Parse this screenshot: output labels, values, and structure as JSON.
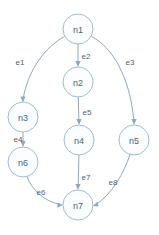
{
  "diagram": {
    "type": "directed-graph",
    "title": "",
    "canvas": {
      "width": 159,
      "height": 235,
      "background": "#ffffff"
    },
    "style": {
      "node_stroke": "#9fbbd4",
      "node_fill": "#fbfdfe",
      "node_radius": 15,
      "edge_stroke": "#8fa8bf",
      "label_color": "#4a5f7a"
    },
    "nodes": [
      {
        "id": "n1",
        "label": "n1",
        "cx": 78,
        "cy": 29
      },
      {
        "id": "n2",
        "label": "n2",
        "cx": 78,
        "cy": 82
      },
      {
        "id": "n3",
        "label": "n3",
        "cx": 23,
        "cy": 117
      },
      {
        "id": "n4",
        "label": "n4",
        "cx": 79,
        "cy": 140
      },
      {
        "id": "n5",
        "label": "n5",
        "cx": 134,
        "cy": 140
      },
      {
        "id": "n6",
        "label": "n6",
        "cx": 23,
        "cy": 162
      },
      {
        "id": "n7",
        "label": "n7",
        "cx": 78,
        "cy": 205
      }
    ],
    "edges": [
      {
        "id": "e1",
        "label": "e1",
        "from": "n1",
        "to": "n3",
        "label_x": 20,
        "label_y": 62
      },
      {
        "id": "e2",
        "label": "e2",
        "from": "n1",
        "to": "n2",
        "label_x": 86,
        "label_y": 56
      },
      {
        "id": "e3",
        "label": "e3",
        "from": "n1",
        "to": "n5",
        "label_x": 130,
        "label_y": 62
      },
      {
        "id": "e4",
        "label": "e4",
        "from": "n3",
        "to": "n6",
        "label_x": 18,
        "label_y": 139
      },
      {
        "id": "e5",
        "label": "e5",
        "from": "n2",
        "to": "n4",
        "label_x": 87,
        "label_y": 112
      },
      {
        "id": "e6",
        "label": "e6",
        "from": "n6",
        "to": "n7",
        "label_x": 41,
        "label_y": 192
      },
      {
        "id": "e7",
        "label": "e7",
        "from": "n4",
        "to": "n7",
        "label_x": 86,
        "label_y": 177
      },
      {
        "id": "e8",
        "label": "e8",
        "from": "n5",
        "to": "n7",
        "label_x": 113,
        "label_y": 182
      }
    ]
  }
}
